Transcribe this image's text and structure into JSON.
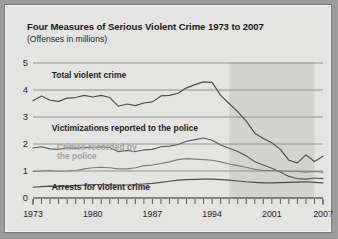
{
  "figure": {
    "title": "Four Measures of Serious Violent Crime 1973 to 2007",
    "subtitle": "(Offenses in millions)"
  },
  "chart_data": {
    "type": "line",
    "title": "Four Measures of Serious Violent Crime 1973 to 2007",
    "subtitle": "(Offenses in millions)",
    "xlabel": "",
    "ylabel": "Offenses in millions",
    "xlim": [
      1973,
      2007
    ],
    "ylim": [
      0,
      5
    ],
    "yticks": [
      0,
      1,
      2,
      3,
      4,
      5
    ],
    "ytick_labels": [
      "0",
      "1",
      "2",
      "3",
      "4",
      "5"
    ],
    "xticks": [
      1973,
      1980,
      1987,
      1994,
      2001,
      2007
    ],
    "xtick_labels": [
      "1973",
      "1980",
      "1987",
      "1994",
      "2001",
      "2007"
    ],
    "minor_xticks_every": 1,
    "grid": "horizontal",
    "legend": "inline-annotations",
    "shaded_band": {
      "x_start": 1996,
      "x_end": 2006,
      "color": "#d2d2d0"
    },
    "annotations": [
      {
        "text": "Total violent crime",
        "x": 1975.2,
        "y": 4.45,
        "style": "dark"
      },
      {
        "text": "Victimizations reported to the police",
        "x": 1975.2,
        "y": 2.48,
        "style": "dark"
      },
      {
        "text": "Crimes recorded by",
        "x": 1975.8,
        "y": 1.76,
        "style": "light"
      },
      {
        "text": "the police",
        "x": 1975.8,
        "y": 1.46,
        "style": "light"
      },
      {
        "text": "Arrests for violent crime",
        "x": 1975.2,
        "y": 0.3,
        "style": "dark"
      }
    ],
    "x": [
      1973,
      1974,
      1975,
      1976,
      1977,
      1978,
      1979,
      1980,
      1981,
      1982,
      1983,
      1984,
      1985,
      1986,
      1987,
      1988,
      1989,
      1990,
      1991,
      1992,
      1993,
      1994,
      1995,
      1996,
      1997,
      1998,
      1999,
      2000,
      2001,
      2002,
      2003,
      2004,
      2005,
      2006,
      2007
    ],
    "series": [
      {
        "name": "Total violent crime",
        "color": "#4d4d4d",
        "values": [
          3.6,
          3.78,
          3.62,
          3.58,
          3.7,
          3.72,
          3.8,
          3.74,
          3.8,
          3.72,
          3.4,
          3.48,
          3.42,
          3.52,
          3.56,
          3.78,
          3.8,
          3.88,
          4.08,
          4.2,
          4.3,
          4.28,
          3.8,
          3.5,
          3.2,
          2.85,
          2.4,
          2.2,
          2.05,
          1.8,
          1.4,
          1.3,
          1.6,
          1.35,
          1.55
        ]
      },
      {
        "name": "Victimizations reported to the police",
        "color": "#5a5a5a",
        "values": [
          1.85,
          1.9,
          1.82,
          1.8,
          1.86,
          1.84,
          1.88,
          1.86,
          1.9,
          1.86,
          1.72,
          1.76,
          1.72,
          1.78,
          1.8,
          1.9,
          1.92,
          1.98,
          2.1,
          2.16,
          2.22,
          2.14,
          1.96,
          1.84,
          1.72,
          1.56,
          1.34,
          1.22,
          1.1,
          0.96,
          0.8,
          0.72,
          0.7,
          0.74,
          0.72
        ]
      },
      {
        "name": "Crimes recorded by the police",
        "color": "#7d7d7b",
        "values": [
          0.98,
          1.0,
          1.02,
          0.99,
          1.0,
          1.02,
          1.08,
          1.12,
          1.14,
          1.12,
          1.08,
          1.08,
          1.12,
          1.2,
          1.22,
          1.28,
          1.34,
          1.42,
          1.46,
          1.44,
          1.42,
          1.4,
          1.34,
          1.26,
          1.2,
          1.14,
          1.06,
          1.02,
          1.02,
          1.0,
          0.98,
          0.98,
          0.96,
          0.98,
          0.96
        ]
      },
      {
        "name": "Arrests for violent crime",
        "color": "#4d4d4d",
        "values": [
          0.4,
          0.42,
          0.44,
          0.43,
          0.44,
          0.46,
          0.48,
          0.5,
          0.5,
          0.49,
          0.48,
          0.48,
          0.5,
          0.52,
          0.54,
          0.58,
          0.62,
          0.66,
          0.68,
          0.69,
          0.7,
          0.7,
          0.68,
          0.66,
          0.63,
          0.6,
          0.58,
          0.56,
          0.56,
          0.57,
          0.58,
          0.59,
          0.6,
          0.58,
          0.56
        ]
      }
    ]
  }
}
